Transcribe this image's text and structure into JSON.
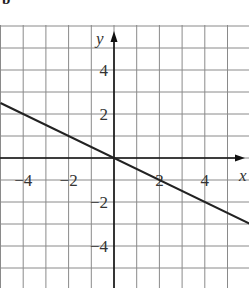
{
  "figure": {
    "part_label": "b",
    "colors": {
      "background": "#ffffff",
      "grid": "#8a8a8a",
      "axis": "#111111",
      "line": "#222222",
      "text": "#333333"
    }
  },
  "chart_data": {
    "type": "line",
    "title": "",
    "xlabel": "x",
    "ylabel": "y",
    "xlim": [
      -5,
      6
    ],
    "ylim": [
      -6,
      6
    ],
    "grid": true,
    "legend": null,
    "x_ticks": [
      -4,
      -2,
      2,
      4
    ],
    "x_tick_labels": [
      "−4",
      "−2",
      "2",
      "4"
    ],
    "y_ticks": [
      4,
      2,
      -2,
      -4
    ],
    "y_tick_labels": [
      "4",
      "2",
      "−2",
      "−4"
    ],
    "series": [
      {
        "name": "y = -x/2",
        "equation": "y = -0.5x",
        "slope": -0.5,
        "intercept": 0,
        "x": [
          -5,
          -4,
          -2,
          0,
          2,
          4,
          6
        ],
        "y": [
          2.5,
          2,
          1,
          0,
          -1,
          -2,
          -3
        ]
      }
    ]
  }
}
